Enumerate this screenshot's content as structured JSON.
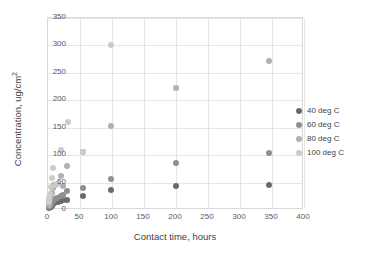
{
  "chart_data": {
    "type": "scatter",
    "title": "",
    "xlabel": "Contact time, hours",
    "ylabel": "Concentration, ug/cm2",
    "ylabel_base": "Concentration, ug/cm",
    "ylabel_exp": "2",
    "xlim": [
      0,
      400
    ],
    "ylim": [
      0,
      350
    ],
    "xticks": [
      0,
      50,
      100,
      150,
      200,
      250,
      300,
      350,
      400
    ],
    "yticks": [
      0,
      50,
      100,
      150,
      200,
      250,
      300,
      350
    ],
    "grid": true,
    "legend_position": "right",
    "series": [
      {
        "name": "40 deg C",
        "color": "#6b6b6b",
        "points": [
          [
            1,
            3
          ],
          [
            2,
            5
          ],
          [
            3,
            7
          ],
          [
            4,
            6
          ],
          [
            5,
            9
          ],
          [
            6,
            8
          ],
          [
            8,
            11
          ],
          [
            10,
            12
          ],
          [
            12,
            14
          ],
          [
            15,
            15
          ],
          [
            20,
            17
          ],
          [
            24,
            18
          ],
          [
            30,
            19
          ],
          [
            55,
            26
          ],
          [
            98,
            37
          ],
          [
            200,
            43
          ],
          [
            345,
            45
          ]
        ]
      },
      {
        "name": "60 deg C",
        "color": "#8f8f8f",
        "points": [
          [
            1,
            5
          ],
          [
            2,
            8
          ],
          [
            3,
            11
          ],
          [
            4,
            10
          ],
          [
            6,
            14
          ],
          [
            8,
            17
          ],
          [
            10,
            20
          ],
          [
            14,
            22
          ],
          [
            20,
            25
          ],
          [
            24,
            28
          ],
          [
            30,
            34
          ],
          [
            55,
            41
          ],
          [
            98,
            57
          ],
          [
            200,
            85
          ],
          [
            345,
            104
          ]
        ]
      },
      {
        "name": "80 deg C",
        "color": "#b0b0b0",
        "points": [
          [
            1,
            9
          ],
          [
            2,
            14
          ],
          [
            3,
            20
          ],
          [
            5,
            26
          ],
          [
            7,
            31
          ],
          [
            8,
            41
          ],
          [
            10,
            45
          ],
          [
            14,
            47
          ],
          [
            20,
            62
          ],
          [
            24,
            44
          ],
          [
            30,
            81
          ],
          [
            55,
            105
          ],
          [
            98,
            154
          ],
          [
            200,
            222
          ],
          [
            345,
            272
          ]
        ]
      },
      {
        "name": "100 deg C",
        "color": "#cccccc",
        "points": [
          [
            1,
            14
          ],
          [
            2,
            22
          ],
          [
            3,
            30
          ],
          [
            5,
            42
          ],
          [
            6,
            58
          ],
          [
            8,
            76
          ],
          [
            12,
            46
          ],
          [
            20,
            110
          ],
          [
            31,
            161
          ],
          [
            55,
            106
          ],
          [
            98,
            301
          ]
        ]
      }
    ]
  },
  "legend": {
    "items": [
      {
        "label": "40 deg C",
        "color": "#6b6b6b"
      },
      {
        "label": "60 deg C",
        "color": "#8f8f8f"
      },
      {
        "label": "80 deg C",
        "color": "#b0b0b0"
      },
      {
        "label": "100 deg C",
        "color": "#cccccc"
      }
    ]
  }
}
